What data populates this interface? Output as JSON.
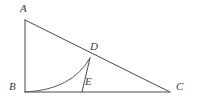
{
  "figure": {
    "kind": "geometry-diagram",
    "background_color": "#ffffff",
    "line_color": "#4a4a4a",
    "arc_color": "#5a5a5a",
    "label_color": "#3a3a3a"
  },
  "points": {
    "A": {
      "label": "A",
      "x": 25,
      "y": 20
    },
    "B": {
      "label": "B",
      "x": 25,
      "y": 92
    },
    "C": {
      "label": "C",
      "x": 170,
      "y": 92
    },
    "D": {
      "label": "D",
      "x": 90,
      "y": 58
    },
    "E": {
      "label": "E",
      "x": 82,
      "y": 92
    }
  },
  "segments": [
    {
      "name": "AB",
      "from": "A",
      "to": "B"
    },
    {
      "name": "BC",
      "from": "B",
      "to": "C"
    },
    {
      "name": "AC",
      "from": "A",
      "to": "C"
    },
    {
      "name": "DE",
      "from": "D",
      "to": "E"
    }
  ],
  "curves": [
    {
      "name": "arc-BD",
      "from": "B",
      "to": "D",
      "path": "M 25 92 Q 72 90 90 58"
    }
  ]
}
